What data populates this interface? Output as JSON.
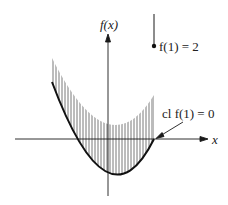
{
  "diagram": {
    "labels": {
      "y_axis": "f(x)",
      "x_axis": "x",
      "point_label": "f(1) = 2",
      "closure_label": "cl f(1) = 0"
    },
    "colors": {
      "ink": "#1a1a1a",
      "hatch": "#555555",
      "background": "#ffffff"
    }
  }
}
